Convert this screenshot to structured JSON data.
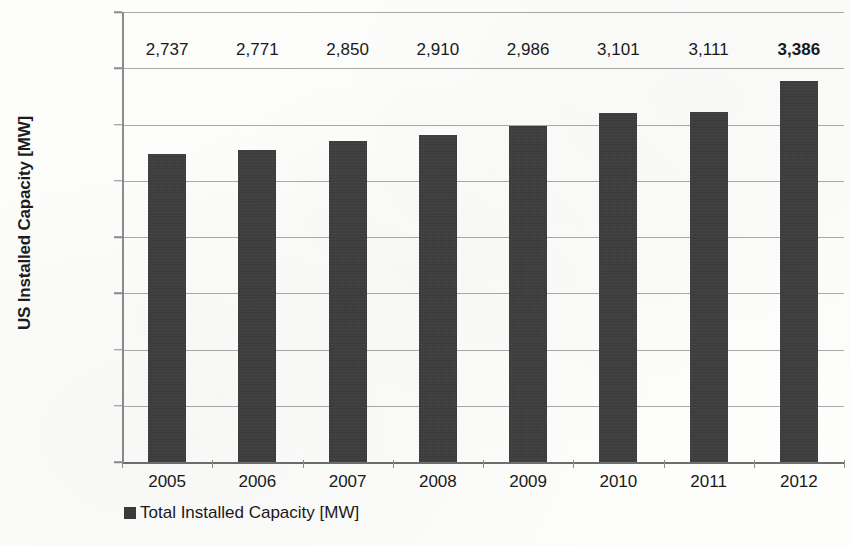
{
  "chart_data": {
    "type": "bar",
    "title": "",
    "subtitle": "",
    "xlabel": "",
    "ylabel": "US Installed Capacity [MW]",
    "categories": [
      "2005",
      "2006",
      "2007",
      "2008",
      "2009",
      "2010",
      "2011",
      "2012"
    ],
    "values": [
      2737,
      2771,
      2850,
      2910,
      2986,
      3101,
      3111,
      3386
    ],
    "data_labels": [
      "2,737",
      "2,771",
      "2,850",
      "2,910",
      "2,986",
      "3,101",
      "3,111",
      "3,386"
    ],
    "emphasized_index": 7,
    "series": [
      {
        "name": "Total Installed Capacity [MW]",
        "values": [
          2737,
          2771,
          2850,
          2910,
          2986,
          3101,
          3111,
          3386
        ],
        "color": "#3b3b3b"
      }
    ],
    "ylim": [
      0,
      4000
    ],
    "ytick_values": [
      0,
      500,
      1000,
      1500,
      2000,
      2500,
      3000,
      3500,
      4000
    ],
    "ytick_labels": [
      "0",
      "500",
      "1,000",
      "1,500",
      "2,000",
      "2,500",
      "3,000",
      "3,500",
      "4,000"
    ],
    "grid": true,
    "grid_axis": "y",
    "grid_color": "#a9a9a9",
    "legend": {
      "position": "bottom-left",
      "entries": [
        {
          "label": "Total Installed Capacity [MW]",
          "color": "#3b3b3b",
          "marker": "square-swatch"
        }
      ]
    },
    "background_color": "#fdfdfc",
    "text_color": "#1a1a1a"
  },
  "axes": {
    "y_title": "US Installed Capacity [MW]"
  },
  "legend": {
    "entry_label": "Total Installed Capacity [MW]"
  }
}
